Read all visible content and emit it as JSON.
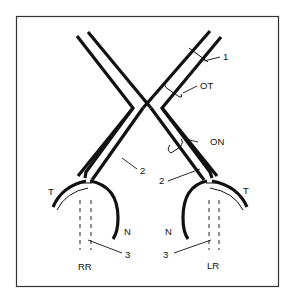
{
  "figure": {
    "labels": {
      "one": "1",
      "ot": "OT",
      "on": "ON",
      "two_left": "2",
      "two_right": "2",
      "t_left": "T",
      "t_right": "T",
      "n_left": "N",
      "n_right": "N",
      "three_left": "3",
      "three_right": "3",
      "rr": "RR",
      "lr": "LR"
    },
    "colors": {
      "ink": "#111111",
      "background": "#ffffff"
    }
  }
}
